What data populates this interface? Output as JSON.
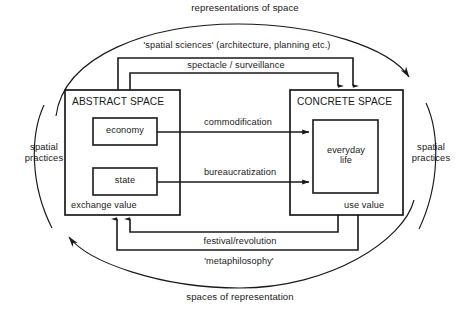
{
  "diagram": {
    "title_top_arc": "representations of space",
    "title_bottom_arc": "spaces of representation",
    "side_left": "spatial\npractices",
    "side_left_line1": "spatial",
    "side_left_line2": "practices",
    "side_right_line1": "spatial",
    "side_right_line2": "practices",
    "boxes": {
      "abstract": {
        "title": "ABSTRACT SPACE",
        "corner_label": "exchange value",
        "inner": [
          {
            "label": "economy"
          },
          {
            "label": "state"
          }
        ]
      },
      "concrete": {
        "title": "CONCRETE SPACE",
        "corner_label": "use value",
        "inner": [
          {
            "label": "everyday\nlife",
            "line1": "everyday",
            "line2": "life"
          }
        ]
      }
    },
    "flows": {
      "top_outer": "'spatial sciences' (architecture, planning etc.)",
      "top_inner": "spectacle / surveillance",
      "middle_upper": "commodification",
      "middle_lower": "bureaucratization",
      "bottom_inner": "festival/revolution",
      "bottom_outer": "'metaphilosophy'"
    },
    "colors": {
      "stroke": "#1a1a1a",
      "text": "#1a1a1a",
      "background": "#ffffff"
    }
  }
}
